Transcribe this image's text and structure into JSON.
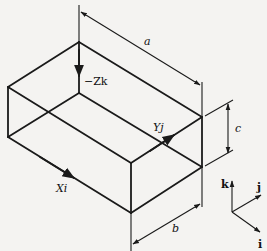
{
  "diagram": {
    "labels": {
      "a": "a",
      "b": "b",
      "c": "c",
      "neg_zk": "−Zk",
      "xi": "Xi",
      "yj": "Yj",
      "k": "k",
      "j": "j",
      "i": "i"
    },
    "vertices": {
      "top_back": [
        79,
        42
      ],
      "top_left": [
        8,
        87
      ],
      "top_front": [
        131,
        163
      ],
      "top_right": [
        202,
        117
      ],
      "bottom_back": [
        79,
        93
      ],
      "bottom_left": [
        8,
        137
      ],
      "bottom_front": [
        131,
        213
      ],
      "bottom_right": [
        202,
        167
      ]
    },
    "dimensions": [
      "a",
      "b",
      "c"
    ],
    "vectors": [
      "−Zk",
      "Xi",
      "Yj"
    ],
    "unit_vectors": [
      "i",
      "j",
      "k"
    ]
  }
}
